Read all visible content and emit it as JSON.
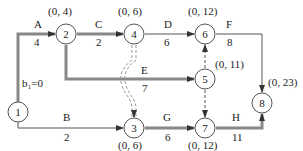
{
  "diagram": {
    "type": "activity-on-arrow network",
    "colors": {
      "line": "#555555",
      "critical": "#888888",
      "node_stroke": "#555555",
      "text": "#222222"
    },
    "nodes": [
      {
        "id": "1",
        "label": "1",
        "annotation": "b₁=0"
      },
      {
        "id": "2",
        "label": "2",
        "annotation": "(0, 4)"
      },
      {
        "id": "3",
        "label": "3",
        "annotation": "(0, 6)"
      },
      {
        "id": "4",
        "label": "4",
        "annotation": "(0, 6)"
      },
      {
        "id": "5",
        "label": "5",
        "annotation": "(0, 11)"
      },
      {
        "id": "6",
        "label": "6",
        "annotation": "(0, 12)"
      },
      {
        "id": "7",
        "label": "7",
        "annotation": "(0, 12)"
      },
      {
        "id": "8",
        "label": "8",
        "annotation": "(0, 23)"
      }
    ],
    "edges": [
      {
        "from": "1",
        "to": "2",
        "name": "A",
        "duration": "4",
        "style": "critical"
      },
      {
        "from": "1",
        "to": "3",
        "name": "B",
        "duration": "2",
        "style": "normal"
      },
      {
        "from": "2",
        "to": "4",
        "name": "C",
        "duration": "2",
        "style": "critical"
      },
      {
        "from": "4",
        "to": "6",
        "name": "D",
        "duration": "6",
        "style": "normal"
      },
      {
        "from": "2",
        "to": "5",
        "name": "E",
        "duration": "7",
        "style": "critical"
      },
      {
        "from": "6",
        "to": "8",
        "name": "F",
        "duration": "8",
        "style": "normal"
      },
      {
        "from": "3",
        "to": "7",
        "name": "G",
        "duration": "6",
        "style": "critical"
      },
      {
        "from": "7",
        "to": "8",
        "name": "H",
        "duration": "11",
        "style": "critical"
      },
      {
        "from": "4",
        "to": "3",
        "name": "",
        "duration": "",
        "style": "dummy-critical"
      },
      {
        "from": "5",
        "to": "6",
        "name": "",
        "duration": "",
        "style": "dummy"
      },
      {
        "from": "5",
        "to": "7",
        "name": "",
        "duration": "",
        "style": "dummy"
      }
    ]
  }
}
